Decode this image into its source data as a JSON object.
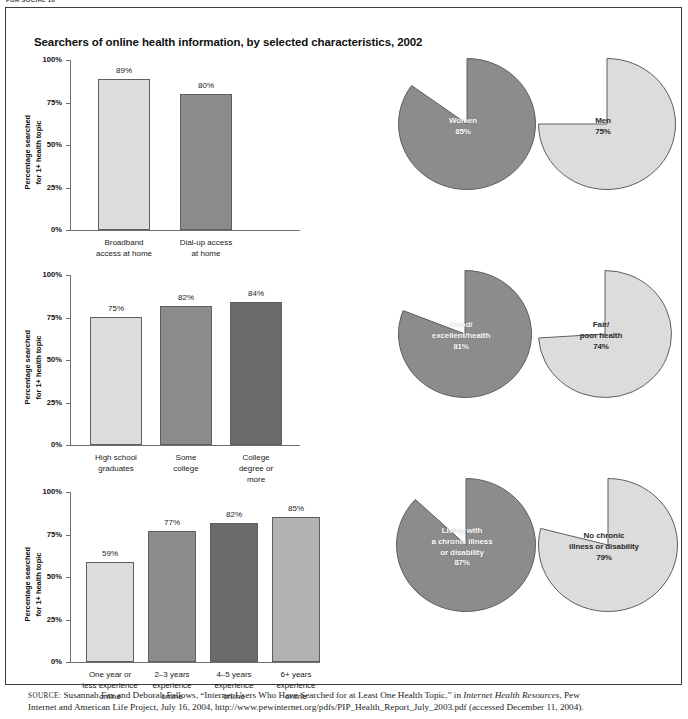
{
  "runhead": "FOR SOCIAL 10",
  "figure": {
    "title": "Searchers of online health information, by selected characteristics, 2002",
    "y_axis_label": "Percentage searched\nfor 1+ health topic",
    "y_ticks": [
      "100%",
      "75%",
      "50%",
      "25%",
      "0%"
    ]
  },
  "source": {
    "label": "SOURCE:",
    "line1_a": " Susannah Fax and Deborah Fallows, “Internet Users Who Have Searched for at Least One Health Topic,” in ",
    "line1_italic": "Internet Health Resources",
    "line1_b": ", Pew",
    "line2": "Internet and American Life Project, July 16, 2004, http://www.pewinternet.org/pdfs/PIP_Health_Report_July_2003.pdf (accessed December 11, 2004)."
  },
  "colors": {
    "light": "#d9d9d9",
    "light2": "#dcdcdc",
    "medium_light": "#b2b2b2",
    "medium": "#8b8b8b",
    "dark": "#7e7e7e",
    "darker": "#6b6b6b",
    "pie_dark": "#8c8c8c",
    "pie_light": "#dcdcdc",
    "outline": "#5e5e5e"
  },
  "chart_data": [
    {
      "type": "bar",
      "id": "internet-access",
      "title": "",
      "ylabel": "Percentage searched for 1+ health topic",
      "xlabel": "",
      "ylim": [
        0,
        100
      ],
      "ytick_labels": [
        "0%",
        "25%",
        "50%",
        "75%",
        "100%"
      ],
      "grid": false,
      "categories": [
        "Broadband\naccess at home",
        "Dial-up access\nat home"
      ],
      "values": [
        89,
        80
      ],
      "value_labels": [
        "89%",
        "80%"
      ],
      "bar_colors": [
        "#dcdcdc",
        "#8b8b8b"
      ]
    },
    {
      "type": "bar",
      "id": "education",
      "title": "",
      "ylabel": "Percentage searched for 1+ health topic",
      "xlabel": "",
      "ylim": [
        0,
        100
      ],
      "ytick_labels": [
        "0%",
        "25%",
        "50%",
        "75%",
        "100%"
      ],
      "grid": false,
      "categories": [
        "High school\ngraduates",
        "Some\ncollege",
        "College\ndegree or\nmore"
      ],
      "values": [
        75,
        82,
        84
      ],
      "value_labels": [
        "75%",
        "82%",
        "84%"
      ],
      "bar_colors": [
        "#dcdcdc",
        "#8b8b8b",
        "#6b6b6b"
      ]
    },
    {
      "type": "bar",
      "id": "online-experience",
      "title": "",
      "ylabel": "Percentage searched for 1+ health topic",
      "xlabel": "",
      "ylim": [
        0,
        100
      ],
      "ytick_labels": [
        "0%",
        "25%",
        "50%",
        "75%",
        "100%"
      ],
      "grid": false,
      "categories": [
        "One year or\nless experience\nonline",
        "2–3 years\nexperience\nonline",
        "4–5 years\nexperience\nonline",
        "6+ years\nexperience\nonline"
      ],
      "values": [
        59,
        77,
        82,
        85
      ],
      "value_labels": [
        "59%",
        "77%",
        "82%",
        "85%"
      ],
      "bar_colors": [
        "#dcdcdc",
        "#8b8b8b",
        "#6b6b6b",
        "#b2b2b2"
      ]
    },
    {
      "type": "pie",
      "id": "gender",
      "title": "",
      "slices": [
        {
          "label": "Women",
          "value_label": "85%",
          "value": 85,
          "color": "#8c8c8c"
        },
        {
          "label": "Men",
          "value_label": "75%",
          "value": 75,
          "color": "#dcdcdc"
        }
      ]
    },
    {
      "type": "pie",
      "id": "health-status",
      "title": "",
      "slices": [
        {
          "label": "Good/\nexcellent/health",
          "value_label": "81%",
          "value": 81,
          "color": "#8c8c8c"
        },
        {
          "label": "Fair/\npoor health",
          "value_label": "74%",
          "value": 74,
          "color": "#dcdcdc"
        }
      ]
    },
    {
      "type": "pie",
      "id": "chronic-illness",
      "title": "",
      "slices": [
        {
          "label": "Living with\na chronic illness\nor disability",
          "value_label": "87%",
          "value": 87,
          "color": "#8c8c8c"
        },
        {
          "label": "No chronic\nillness or disability",
          "value_label": "79%",
          "value": 79,
          "color": "#dcdcdc"
        }
      ]
    }
  ]
}
